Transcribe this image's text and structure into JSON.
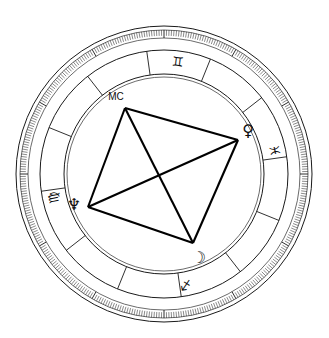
{
  "title": "",
  "chart_data": {
    "type": "scatter",
    "title": "",
    "subtitle": "",
    "xlabel": "",
    "ylabel": "",
    "geometry": {
      "center_x": 164,
      "center_y": 174,
      "radius_outer": 148,
      "radius_degree_ring_outer": 144,
      "radius_degree_ring_inner": 136,
      "radius_sign_band_outer": 124,
      "radius_sign_band_inner": 100,
      "radius_inner_circle": 97
    },
    "rings": [
      {
        "name": "outer-circle",
        "radius": 148
      },
      {
        "name": "degree-ring-outer",
        "radius": 144
      },
      {
        "name": "degree-ring-inner",
        "radius": 136
      },
      {
        "name": "sign-band-outer",
        "radius": 124
      },
      {
        "name": "sign-band-inner",
        "radius": 100
      },
      {
        "name": "inner-circle",
        "radius": 97
      }
    ],
    "degree_ticks": {
      "count": 360,
      "major_every": 30,
      "grid": true
    },
    "house_cusps_deg": [
      8,
      38,
      68,
      98,
      128,
      158,
      188,
      218,
      248,
      278,
      308,
      338
    ],
    "zodiac_signs": [
      {
        "name": "Gemini",
        "glyph": "♊",
        "angle_deg": 83,
        "label_radius": 112
      },
      {
        "name": "Pisces",
        "glyph": "♓",
        "angle_deg": 12,
        "label_radius": 112
      },
      {
        "name": "Virgo",
        "glyph": "♍",
        "angle_deg": 192,
        "label_radius": 112
      },
      {
        "name": "Sagittarius",
        "glyph": "♐",
        "angle_deg": 281,
        "label_radius": 112
      }
    ],
    "points": [
      {
        "name": "Midheaven",
        "label": "MC",
        "kind": "angle",
        "angle_deg": 107,
        "radius": 82,
        "x": 125,
        "y": 108,
        "label_x": 116,
        "label_y": 97
      },
      {
        "name": "Venus",
        "glyph": "♀",
        "kind": "planet",
        "angle_deg": 26,
        "radius": 82,
        "x": 238,
        "y": 140,
        "label_x": 248,
        "label_y": 131
      },
      {
        "name": "Moon",
        "glyph": "☽",
        "kind": "planet",
        "angle_deg": 289,
        "radius": 73,
        "x": 193,
        "y": 243,
        "label_x": 199,
        "label_y": 258
      },
      {
        "name": "Neptune",
        "glyph": "♆",
        "kind": "planet",
        "angle_deg": 179,
        "radius": 79,
        "x": 88,
        "y": 207,
        "label_x": 74,
        "label_y": 205
      }
    ],
    "aspect_lines": [
      {
        "from": "Midheaven",
        "to": "Venus",
        "x1": 125,
        "y1": 108,
        "x2": 238,
        "y2": 140
      },
      {
        "from": "Venus",
        "to": "Moon",
        "x1": 238,
        "y1": 140,
        "x2": 193,
        "y2": 243
      },
      {
        "from": "Moon",
        "to": "Neptune",
        "x1": 193,
        "y1": 243,
        "x2": 88,
        "y2": 207
      },
      {
        "from": "Neptune",
        "to": "Midheaven",
        "x1": 88,
        "y1": 207,
        "x2": 125,
        "y2": 108
      },
      {
        "from": "Midheaven",
        "to": "Moon",
        "x1": 125,
        "y1": 108,
        "x2": 193,
        "y2": 243
      },
      {
        "from": "Neptune",
        "to": "Venus",
        "x1": 88,
        "y1": 207,
        "x2": 238,
        "y2": 140
      }
    ],
    "colors": {
      "background": "#ffffff",
      "line": "#1a1a1a",
      "aspect": "#000000",
      "glyph": "#0d0d0d"
    }
  }
}
